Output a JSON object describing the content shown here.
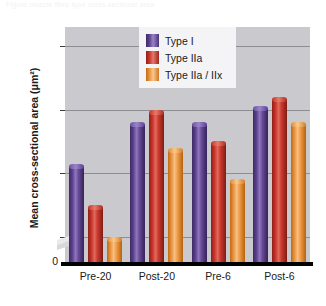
{
  "caption": {
    "text": "Figure   muscle fibre type cross-sectional area"
  },
  "chart_data": {
    "type": "bar",
    "title": "",
    "xlabel": "",
    "ylabel": "Mean cross-sectional area (μm²)",
    "categories": [
      "Pre-20",
      "Post-20",
      "Pre-6",
      "Post-6"
    ],
    "series": [
      {
        "name": "Type I",
        "color": "#5B3F8E",
        "values": [
          4150,
          4800,
          4800,
          5050
        ]
      },
      {
        "name": "Type IIa",
        "color": "#C8322A",
        "values": [
          3500,
          5000,
          4500,
          5200
        ]
      },
      {
        "name": "Type IIa / IIx",
        "color": "#E8903A",
        "values": [
          3000,
          4400,
          3900,
          4800
        ]
      }
    ],
    "ylim": [
      2600,
      6300
    ],
    "yticks": [
      3000,
      4000,
      5000,
      6000
    ],
    "ytick_labels": [
      "3,000",
      "4,000",
      "5,000",
      "6,000"
    ],
    "zero_label": "0",
    "axis_break": true,
    "grid": true,
    "legend_position": "top-center",
    "plot_background": "#C9C9CE",
    "legend_background": "#F4F4F6",
    "baseline_color": "#000000"
  },
  "legend": {
    "items": [
      {
        "label": "Type I"
      },
      {
        "label": "Type IIa"
      },
      {
        "label": "Type IIa / IIx"
      }
    ]
  }
}
